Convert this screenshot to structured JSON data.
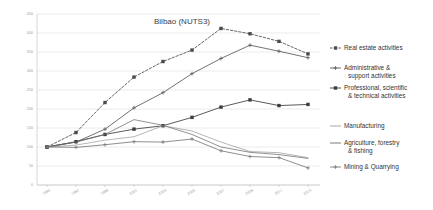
{
  "chart_data": {
    "type": "line",
    "title": "Bilbao (NUTS3)",
    "xlabel": "",
    "ylabel": "",
    "ylim": [
      0,
      450
    ],
    "ytick_step": 50,
    "yticks": [
      0,
      50,
      100,
      150,
      200,
      250,
      300,
      350,
      400,
      450
    ],
    "grid": true,
    "legend_position": "right",
    "categories": [
      "1995",
      "1997",
      "1999",
      "2001",
      "2003",
      "2005",
      "2007",
      "2009",
      "2011",
      "2013"
    ],
    "series": [
      {
        "name": "Real estate activities",
        "style": "dashed",
        "marker": "square",
        "color": "#4a4a4a",
        "values": [
          100,
          138,
          217,
          284,
          325,
          355,
          412,
          398,
          378,
          345
        ]
      },
      {
        "name": "Administrative & support activities",
        "style": "solid",
        "marker": "plus",
        "color": "#5a5a5a",
        "values": [
          100,
          113,
          147,
          203,
          243,
          293,
          333,
          368,
          352,
          335
        ]
      },
      {
        "name": "Professional, scientific & technical activities",
        "style": "solid",
        "marker": "square",
        "color": "#3d3d3d",
        "values": [
          100,
          114,
          133,
          147,
          156,
          178,
          205,
          224,
          209,
          212
        ]
      },
      {
        "name": "Manufacturing",
        "style": "solid",
        "marker": "none",
        "color": "#9d9d9d",
        "values": [
          100,
          105,
          118,
          127,
          156,
          142,
          113,
          88,
          85,
          72
        ]
      },
      {
        "name": "Agriculture, forestry & fishing",
        "style": "solid",
        "marker": "none",
        "color": "#6e6e6e",
        "values": [
          100,
          113,
          133,
          172,
          157,
          133,
          100,
          86,
          80,
          70
        ]
      },
      {
        "name": "Mining & Quarrying",
        "style": "solid",
        "marker": "plus",
        "color": "#7a7a7a",
        "values": [
          100,
          99,
          106,
          114,
          113,
          121,
          90,
          75,
          72,
          45
        ]
      }
    ]
  },
  "legend": {
    "items": [
      {
        "label": "Real estate activities",
        "label2": ""
      },
      {
        "label": "Administrative &",
        "label2": "support activities"
      },
      {
        "label": "Professional, scientific",
        "label2": "& technical activities"
      },
      {
        "label": "Manufacturing",
        "label2": ""
      },
      {
        "label": "Agriculture, forestry",
        "label2": "& fishing"
      },
      {
        "label": "Mining & Quarrying",
        "label2": ""
      }
    ]
  }
}
